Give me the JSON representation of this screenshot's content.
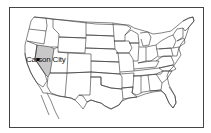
{
  "map": {
    "type": "US states outline map",
    "highlighted_state": "Nevada",
    "highlight_color": "#c8c8c8",
    "city_marker": {
      "label": "Carson City",
      "marker_shape": "square",
      "marker_color": "#000000"
    }
  }
}
